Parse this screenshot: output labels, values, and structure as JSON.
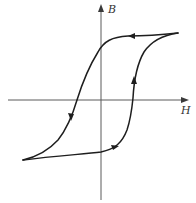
{
  "diagram": {
    "type": "hysteresis-loop",
    "axes": {
      "x_label": "H",
      "y_label": "B"
    },
    "colors": {
      "curve": "#1e1e1e",
      "axis": "#5a5a5a",
      "background": "#ffffff"
    },
    "branches": [
      {
        "name": "descending",
        "direction": "right-to-left then down",
        "from": "positive saturation",
        "to": "negative saturation"
      },
      {
        "name": "ascending",
        "direction": "left-to-right then up",
        "from": "negative saturation",
        "to": "positive saturation"
      }
    ]
  }
}
